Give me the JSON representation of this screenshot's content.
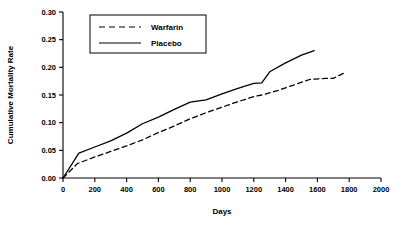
{
  "chart_data": {
    "type": "line",
    "title": "",
    "xlabel": "Days",
    "ylabel": "Cumulative Mortality Rate",
    "xlim": [
      0,
      2000
    ],
    "ylim": [
      0.0,
      0.3
    ],
    "grid": false,
    "legend_position": "top-left-inside",
    "xticks": [
      0,
      200,
      400,
      600,
      800,
      1000,
      1200,
      1400,
      1600,
      1800,
      2000
    ],
    "xtick_labels": [
      "0",
      "200",
      "400",
      "600",
      "800",
      "1000",
      "1200",
      "1400",
      "1600",
      "1800",
      "2000"
    ],
    "yticks": [
      0.0,
      0.05,
      0.1,
      0.15,
      0.2,
      0.25,
      0.3
    ],
    "ytick_labels": [
      "0.00",
      "0.05",
      "0.10",
      "0.15",
      "0.20",
      "0.25",
      "0.30"
    ],
    "series": [
      {
        "name": "Warfarin",
        "style": "dashed",
        "color": "#000000",
        "points": [
          [
            0,
            0.0
          ],
          [
            90,
            0.026
          ],
          [
            200,
            0.038
          ],
          [
            300,
            0.048
          ],
          [
            400,
            0.058
          ],
          [
            500,
            0.069
          ],
          [
            600,
            0.082
          ],
          [
            700,
            0.094
          ],
          [
            800,
            0.107
          ],
          [
            900,
            0.118
          ],
          [
            1000,
            0.128
          ],
          [
            1100,
            0.138
          ],
          [
            1200,
            0.147
          ],
          [
            1250,
            0.15
          ],
          [
            1350,
            0.158
          ],
          [
            1450,
            0.168
          ],
          [
            1550,
            0.178
          ],
          [
            1650,
            0.18
          ],
          [
            1700,
            0.18
          ],
          [
            1770,
            0.19
          ]
        ]
      },
      {
        "name": "Placebo",
        "style": "solid",
        "color": "#000000",
        "points": [
          [
            0,
            0.0
          ],
          [
            100,
            0.045
          ],
          [
            200,
            0.056
          ],
          [
            300,
            0.067
          ],
          [
            400,
            0.081
          ],
          [
            500,
            0.098
          ],
          [
            600,
            0.11
          ],
          [
            700,
            0.124
          ],
          [
            800,
            0.137
          ],
          [
            900,
            0.141
          ],
          [
            1000,
            0.152
          ],
          [
            1100,
            0.162
          ],
          [
            1200,
            0.171
          ],
          [
            1250,
            0.172
          ],
          [
            1300,
            0.192
          ],
          [
            1400,
            0.208
          ],
          [
            1500,
            0.222
          ],
          [
            1580,
            0.23
          ]
        ]
      }
    ],
    "legend": [
      {
        "label": "Warfarin",
        "style": "dashed"
      },
      {
        "label": "Placebo",
        "style": "solid"
      }
    ]
  }
}
